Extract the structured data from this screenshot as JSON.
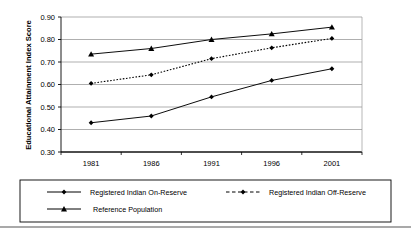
{
  "chart_data": {
    "type": "line",
    "title": "",
    "xlabel": "",
    "ylabel": "Educational Attainment Index Score",
    "categories": [
      "1981",
      "1986",
      "1991",
      "1996",
      "2001"
    ],
    "ylim": [
      0.3,
      0.9
    ],
    "yticks": [
      "0.30",
      "0.40",
      "0.50",
      "0.60",
      "0.70",
      "0.80",
      "0.90"
    ],
    "ytick_values": [
      0.3,
      0.4,
      0.5,
      0.6,
      0.7,
      0.8,
      0.9
    ],
    "grid": true,
    "legend_position": "bottom",
    "series": [
      {
        "name": "Registered Indian On-Reserve",
        "values": [
          0.43,
          0.46,
          0.545,
          0.618,
          0.67
        ],
        "marker": "diamond",
        "line_style": "solid",
        "color": "#000000"
      },
      {
        "name": "Registered Indian Off-Reserve",
        "values": [
          0.605,
          0.643,
          0.715,
          0.763,
          0.805
        ],
        "marker": "diamond",
        "line_style": "dotted",
        "color": "#000000"
      },
      {
        "name": "Reference Population",
        "values": [
          0.735,
          0.76,
          0.8,
          0.825,
          0.855
        ],
        "marker": "triangle",
        "line_style": "solid",
        "color": "#000000"
      }
    ]
  },
  "colors": {
    "axis": "#000000",
    "grid": "#808080",
    "plot_background": "#ffffff",
    "legend_border": "#000000",
    "footer_rule": "#555555"
  },
  "legend": {
    "entries": [
      {
        "label": "Registered Indian On-Reserve"
      },
      {
        "label": "Registered Indian Off-Reserve"
      },
      {
        "label": "Reference Population"
      }
    ]
  }
}
